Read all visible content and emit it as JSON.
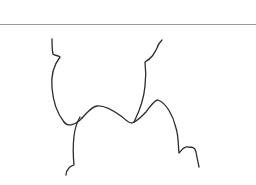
{
  "figure": {
    "width": 256,
    "height": 185,
    "background": "#ffffff",
    "line_color": "#2b2b2b",
    "rule_color": "#9a9a9a",
    "rule_y": 24.5
  },
  "paths": [
    {
      "name": "left-upper-curve",
      "d": "M52,39 C52,45 52,50 53,54 C55,56 58,55 60,57 C53,66 51,78 52,88 C53,100 56,112 64,122 C68,127 74,125 79,121 C80,120 81,119 82,118"
    },
    {
      "name": "middle-wave",
      "d": "M82,118 C87,113 91,107 97,106 C105,105 114,111 121,116 C125,119 128,123 132,123 C138,121 142,116 146,112 C150,107 154,100 158,100 C166,103 173,115 176,128 C179,138 178,146 179,153 C182,150 184,146 188,147 C192,147 195,147 196,152 C197,158 198,162 199,167"
    },
    {
      "name": "right-upper-curve",
      "d": "M162,40 C160,42 158,44 157,48 C154,54 152,58 145,62 C146,70 146,78 145,86 C144,98 140,110 134,122"
    },
    {
      "name": "lower-left-stem",
      "d": "M80,117 C77,122 75,128 74,136 C73,145 73,155 74,165 C72,166 70,166 69,168 C67,170 66,172 66,175"
    }
  ]
}
